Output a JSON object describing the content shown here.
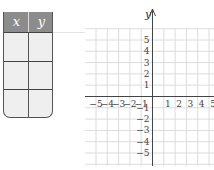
{
  "table": {
    "headers": [
      "x",
      "y"
    ],
    "rows": [
      [
        "",
        ""
      ],
      [
        "",
        ""
      ],
      [
        "",
        ""
      ]
    ],
    "header_color": "#8c8c8c",
    "cell_color": "#efefef"
  },
  "graph": {
    "x_axis_label": "",
    "y_axis_label": "y",
    "x_ticks_negative": [
      "−5",
      "−4",
      "−3",
      "−2",
      "−1"
    ],
    "x_ticks_positive": [
      "1",
      "2",
      "3",
      "4",
      "5"
    ],
    "y_ticks_positive": [
      "5",
      "4",
      "3",
      "2",
      "1"
    ],
    "y_ticks_negative": [
      "−1",
      "−2",
      "−3",
      "−4",
      "−5"
    ],
    "grid_color": "#dcdcdc",
    "axis_color": "#444444"
  }
}
